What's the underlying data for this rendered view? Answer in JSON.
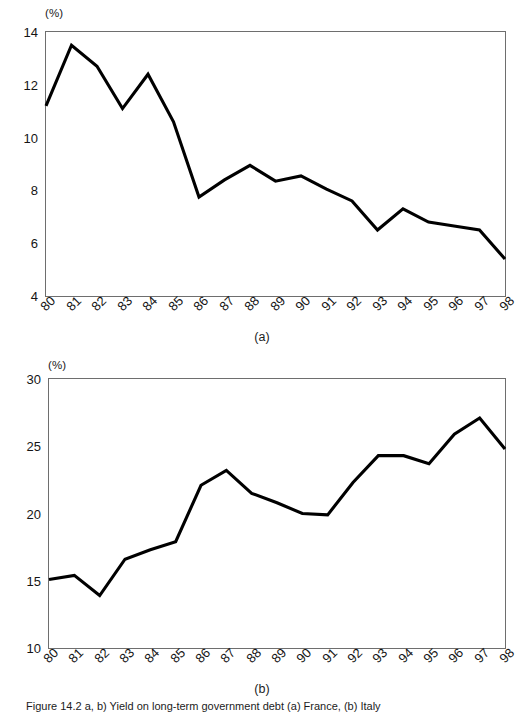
{
  "figure": {
    "caption_text": "Figure 14.2   a, b) Yield on long-term government debt (a) France, (b) Italy"
  },
  "panels": [
    {
      "id": "a",
      "caption": "(a)",
      "unit_label": "(%)",
      "y_ticks": [
        "4",
        "6",
        "8",
        "10",
        "12",
        "14"
      ],
      "x_ticks": [
        "80",
        "81",
        "82",
        "83",
        "84",
        "85",
        "86",
        "87",
        "88",
        "89",
        "90",
        "91",
        "92",
        "93",
        "94",
        "95",
        "96",
        "97",
        "98"
      ]
    },
    {
      "id": "b",
      "caption": "(b)",
      "unit_label": "(%)",
      "y_ticks": [
        "10",
        "15",
        "20",
        "25",
        "30"
      ],
      "x_ticks": [
        "80",
        "81",
        "82",
        "83",
        "84",
        "85",
        "86",
        "87",
        "88",
        "89",
        "90",
        "91",
        "92",
        "93",
        "94",
        "95",
        "96",
        "97",
        "98"
      ]
    }
  ],
  "chart_data": [
    {
      "type": "line",
      "panel": "a",
      "title": "",
      "xlabel": "",
      "ylabel": "(%)",
      "grid": false,
      "legend": "none",
      "xlim": [
        1980,
        1998
      ],
      "ylim": [
        4,
        14
      ],
      "y_tick_values": [
        4,
        6,
        8,
        10,
        12,
        14
      ],
      "categories": [
        "80",
        "81",
        "82",
        "83",
        "84",
        "85",
        "86",
        "87",
        "88",
        "89",
        "90",
        "91",
        "92",
        "93",
        "94",
        "95",
        "96",
        "97",
        "98"
      ],
      "x": [
        1980,
        1981,
        1982,
        1983,
        1984,
        1985,
        1986,
        1987,
        1988,
        1989,
        1990,
        1991,
        1992,
        1993,
        1994,
        1995,
        1996,
        1997,
        1998
      ],
      "values": [
        11.2,
        13.5,
        12.7,
        11.1,
        12.4,
        10.6,
        7.75,
        8.4,
        8.95,
        8.35,
        8.55,
        8.05,
        7.6,
        6.5,
        7.3,
        6.8,
        6.65,
        6.5,
        5.4
      ],
      "series": [
        {
          "name": "series-a",
          "color": "#000000",
          "values": [
            11.2,
            13.5,
            12.7,
            11.1,
            12.4,
            10.6,
            7.75,
            8.4,
            8.95,
            8.35,
            8.55,
            8.05,
            7.6,
            6.5,
            7.3,
            6.8,
            6.65,
            6.5,
            5.4
          ]
        }
      ]
    },
    {
      "type": "line",
      "panel": "b",
      "title": "",
      "xlabel": "",
      "ylabel": "(%)",
      "grid": false,
      "legend": "none",
      "xlim": [
        1980,
        1998
      ],
      "ylim": [
        10,
        30
      ],
      "y_tick_values": [
        10,
        15,
        20,
        25,
        30
      ],
      "categories": [
        "80",
        "81",
        "82",
        "83",
        "84",
        "85",
        "86",
        "87",
        "88",
        "89",
        "90",
        "91",
        "92",
        "93",
        "94",
        "95",
        "96",
        "97",
        "98"
      ],
      "x": [
        1980,
        1981,
        1982,
        1983,
        1984,
        1985,
        1986,
        1987,
        1988,
        1989,
        1990,
        1991,
        1992,
        1993,
        1994,
        1995,
        1996,
        1997,
        1998
      ],
      "values": [
        15.1,
        15.4,
        13.9,
        16.6,
        17.3,
        17.9,
        22.1,
        23.2,
        21.5,
        20.8,
        20.0,
        19.9,
        22.3,
        24.3,
        24.3,
        23.7,
        25.9,
        27.1,
        24.8
      ],
      "series": [
        {
          "name": "series-b",
          "color": "#000000",
          "values": [
            15.1,
            15.4,
            13.9,
            16.6,
            17.3,
            17.9,
            22.1,
            23.2,
            21.5,
            20.8,
            20.0,
            19.9,
            22.3,
            24.3,
            24.3,
            23.7,
            25.9,
            27.1,
            24.8
          ]
        }
      ]
    }
  ]
}
